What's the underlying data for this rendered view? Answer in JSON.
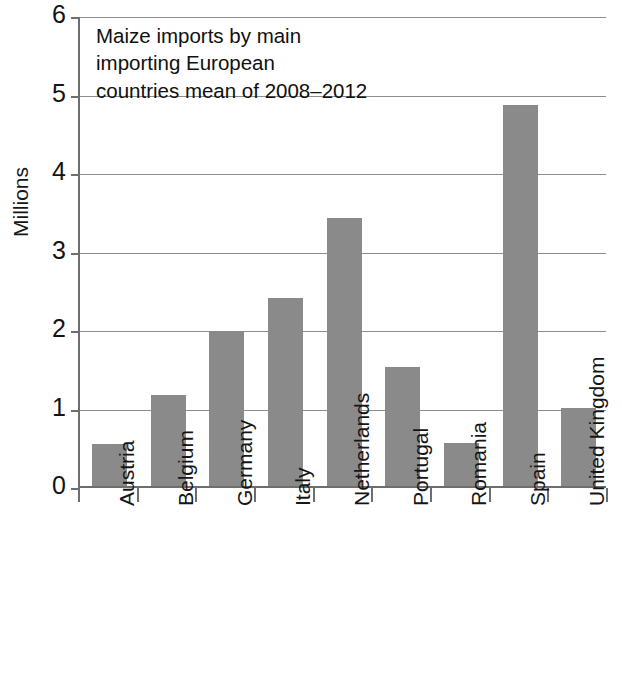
{
  "chart_data": {
    "type": "bar",
    "title_lines": [
      "Maize imports by main",
      "importing European",
      "countries mean of 2008–2012"
    ],
    "xlabel": "",
    "ylabel": "Millions",
    "ylim": [
      0,
      6
    ],
    "ytick_labels": [
      "0",
      "1",
      "2",
      "3",
      "4",
      "5",
      "6"
    ],
    "ytick_values": [
      0,
      1,
      2,
      3,
      4,
      5,
      6
    ],
    "grid": true,
    "legend": false,
    "bar_color": "#8a8a8a",
    "axis_color": "#6e6e6e",
    "categories": [
      "Austria",
      "Belgium",
      "Germany",
      "Italy",
      "Netherlands",
      "Portugal",
      "Romania",
      "Spain",
      "United Kingdom"
    ],
    "values": [
      0.53,
      1.16,
      1.97,
      2.39,
      3.41,
      1.52,
      0.55,
      4.85,
      1.0
    ]
  }
}
